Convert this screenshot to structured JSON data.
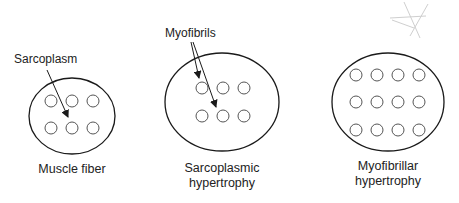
{
  "diagram": {
    "panels": [
      {
        "caption_lines": [
          "Muscle fiber",
          ""
        ],
        "callout": "Sarcoplasm",
        "myofibril_grid": {
          "rows": 2,
          "cols": 3
        }
      },
      {
        "caption_lines": [
          "Sarcoplasmic",
          "hypertrophy"
        ],
        "callout": "Myofibrils",
        "myofibril_grid": {
          "rows": 2,
          "cols": 3
        }
      },
      {
        "caption_lines": [
          "Myofibrillar",
          "hypertrophy"
        ],
        "callout": "",
        "myofibril_grid": {
          "rows": 3,
          "cols": 4
        }
      }
    ],
    "colors": {
      "outline": "#1a1a1a",
      "myofibril": "#555555",
      "watermark": "#cfcfcf"
    }
  }
}
